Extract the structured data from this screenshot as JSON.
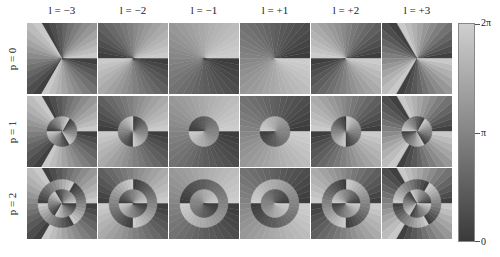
{
  "figure": {
    "column_labels": [
      "l = −3",
      "l = −2",
      "l = −1",
      "l = +1",
      "l = +2",
      "l = +3"
    ],
    "l_values": [
      -3,
      -2,
      -1,
      1,
      2,
      3
    ],
    "row_labels": [
      "p = 0",
      "p = 1",
      "p = 2"
    ],
    "p_values": [
      0,
      1,
      2
    ],
    "colorbar": {
      "ticks": [
        "2π",
        "π",
        "0"
      ],
      "min": 0,
      "max": "2π",
      "colors": {
        "low": "#3a3a3a",
        "high": "#cfcfcf"
      }
    }
  }
}
